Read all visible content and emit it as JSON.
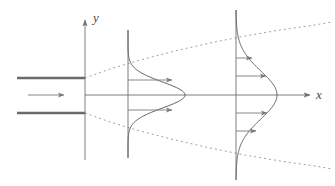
{
  "figure": {
    "width": 335,
    "height": 186,
    "background_color": "#ffffff"
  },
  "axes": {
    "x_axis": {
      "label": "x",
      "color": "#6f6f6f",
      "y_position": 95,
      "x_start": 85,
      "x_end": 312,
      "arrowhead": true
    },
    "y_axis": {
      "label": "y",
      "color": "#6f6f6f",
      "x_position": 85,
      "y_start": 160,
      "y_end": 18,
      "arrowhead": true
    }
  },
  "nozzle": {
    "name": "slot-nozzle",
    "color": "#6a6a6a",
    "plate_thickness": 2.5,
    "upper_plate": {
      "x_start": 17,
      "x_end": 85,
      "y": 78
    },
    "lower_plate": {
      "x_start": 17,
      "x_end": 85,
      "y": 113
    },
    "slot_half_width": 17.5,
    "inlet_arrow": {
      "x_start": 28,
      "x_end": 66,
      "y": 95,
      "color": "#7a7a7a"
    }
  },
  "spreading_boundary": {
    "name": "jet-spreading-envelope",
    "color": "#b09a9a",
    "style": "dashed",
    "dash_pattern": "2,3",
    "upper_points": "85,78 110,69 140,60 175,51 210,43 245,36 280,30 315,25 332,22",
    "lower_points": "85,113 110,122 140,131 175,140 210,148 245,155 280,161 315,166 332,169"
  },
  "stations": [
    {
      "name": "station-1",
      "line_x": 128,
      "line_y_top": 30,
      "line_y_bottom": 158,
      "line_color": "#6f6f6f",
      "profile_color": "#555555",
      "peak_x": 185,
      "peak_amplitude": 57,
      "sigma": 13,
      "arrows": [
        {
          "y": 80,
          "length": 44
        },
        {
          "y": 110,
          "length": 44
        }
      ]
    },
    {
      "name": "station-2",
      "line_x": 236,
      "line_y_top": 10,
      "line_y_bottom": 180,
      "line_color": "#6f6f6f",
      "profile_color": "#555555",
      "peak_x": 277,
      "peak_amplitude": 41,
      "sigma": 24,
      "arrows": [
        {
          "y": 58,
          "length": 16
        },
        {
          "y": 76,
          "length": 30
        },
        {
          "y": 113,
          "length": 31
        },
        {
          "y": 131,
          "length": 20
        }
      ]
    }
  ],
  "colors": {
    "axis": "#6f6f6f",
    "profile_curve": "#555555",
    "spreading_dashed": "#b09a9a",
    "nozzle_plate": "#6a6a6a",
    "arrow": "#7a7a7a",
    "label_text": "#4a4a4a"
  }
}
